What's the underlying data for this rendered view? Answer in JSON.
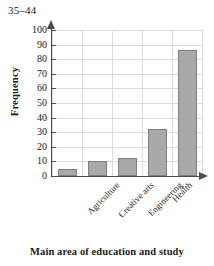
{
  "chart_data": {
    "type": "bar",
    "title": "35–44",
    "xlabel": "Main area of education and study",
    "ylabel": "Frequency",
    "categories": [
      "Agriculture",
      "Creative arts",
      "Engineering",
      "Health",
      "Management and commerce"
    ],
    "values": [
      5,
      10,
      12.5,
      32,
      86
    ],
    "ylim": [
      0,
      100
    ],
    "ytick_step": 10,
    "yticks": [
      0,
      10,
      20,
      30,
      40,
      50,
      60,
      70,
      80,
      90,
      100
    ],
    "ytick_labels": [
      "0",
      "10",
      "20",
      "30",
      "40",
      "50",
      "60",
      "70",
      "80",
      "90",
      "100"
    ],
    "grid": true,
    "legend": "none",
    "bar_color": "#a9a9a9",
    "bar_border_color": "#808080",
    "grid_color": "#dcdcdc",
    "axis_color": "#4d4d4d"
  }
}
